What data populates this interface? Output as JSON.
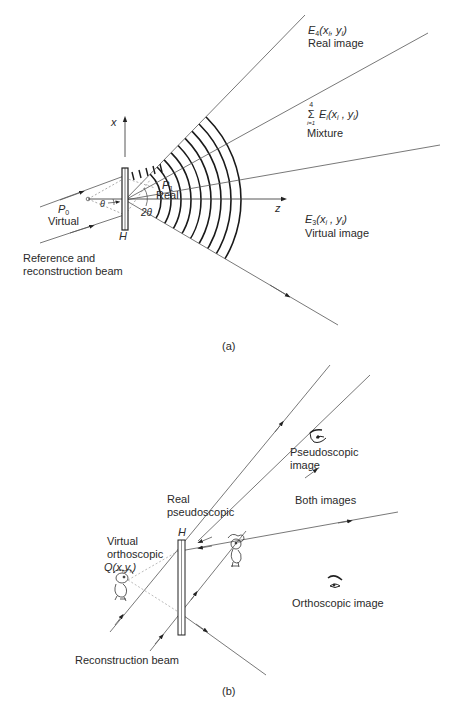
{
  "figure_a": {
    "caption": "(a)",
    "axis_x": "x",
    "axis_z": "z",
    "hologram": "H",
    "e4": {
      "symbol": "E",
      "sub": "4",
      "args": "(x",
      "argsub1": "i",
      "mid": ", y",
      "argsub2": "i",
      "close": ")",
      "desc": "Real image"
    },
    "mixture": {
      "sum_top": "4",
      "sum_sym": "Σ",
      "sum_bottom": "i=1",
      "symbol": "E",
      "sub": "i",
      "args": "(x",
      "argsub1": "i",
      "mid": " , y",
      "argsub2": "i",
      "close": ")",
      "desc": "Mixture"
    },
    "e3": {
      "symbol": "E",
      "sub": "3",
      "args": "(x",
      "argsub1": "i",
      "mid": " , y",
      "argsub2": "i",
      "close": ")",
      "desc": "Virtual image"
    },
    "p0": {
      "symbol": "P",
      "sub": "0",
      "desc": "Virtual"
    },
    "p1": {
      "symbol": "P",
      "sub": "1",
      "desc": "Real"
    },
    "theta": "θ",
    "two_theta": "2θ",
    "beam_label_line1": "Reference and",
    "beam_label_line2": "reconstruction beam"
  },
  "figure_b": {
    "caption": "(b)",
    "hologram": "H",
    "pseudoscopic_image": [
      "Pseudoscopic",
      "image"
    ],
    "both_images": "Both images",
    "real_pseudoscopic": [
      "Real",
      "pseudoscopic"
    ],
    "virtual_orthoscopic": [
      "Virtual",
      "orthoscopic"
    ],
    "q_point": "Q(x,y,)",
    "orthoscopic_image": "Orthoscopic image",
    "reconstruction_beam": "Reconstruction beam"
  },
  "colors": {
    "line": "#555555",
    "ink": "#2a2a2a",
    "wave": "#1a1a1a"
  }
}
